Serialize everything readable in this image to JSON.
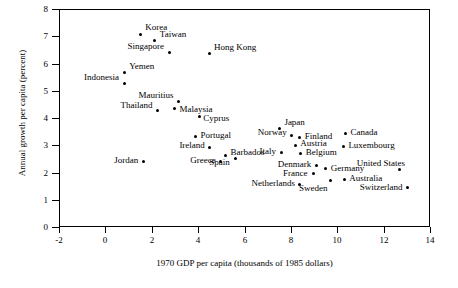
{
  "chart_data": {
    "type": "scatter",
    "title": "",
    "xlabel": "1970 GDP per capita (thousands of 1985 dollars)",
    "ylabel": "Annual growth per capita (percent)",
    "xlim": [
      -2,
      14
    ],
    "ylim": [
      0,
      8
    ],
    "xticks": [
      "-2",
      "0",
      "2",
      "4",
      "6",
      "8",
      "10",
      "12",
      "14"
    ],
    "xtick_values": [
      -2,
      0,
      2,
      4,
      6,
      8,
      10,
      12,
      14
    ],
    "yticks": [
      "0",
      "1",
      "2",
      "3",
      "4",
      "5",
      "6",
      "7",
      "8"
    ],
    "ytick_values": [
      0,
      1,
      2,
      3,
      4,
      5,
      6,
      7,
      8
    ],
    "grid": false,
    "legend": false,
    "points": [
      {
        "label": "Korea",
        "x": 1.5,
        "y": 7.07,
        "lx": 1.72,
        "ly": 7.3,
        "anchor": "left"
      },
      {
        "label": "Taiwan",
        "x": 2.13,
        "y": 6.85,
        "lx": 2.35,
        "ly": 7.05,
        "anchor": "left"
      },
      {
        "label": "Singapore",
        "x": 2.77,
        "y": 6.4,
        "lx": 2.55,
        "ly": 6.6,
        "anchor": "right"
      },
      {
        "label": "Hong Kong",
        "x": 4.47,
        "y": 6.36,
        "lx": 4.69,
        "ly": 6.57,
        "anchor": "left"
      },
      {
        "label": "Yemen",
        "x": 0.81,
        "y": 5.66,
        "lx": 1.03,
        "ly": 5.86,
        "anchor": "left"
      },
      {
        "label": "Indonesia",
        "x": 0.81,
        "y": 5.27,
        "lx": 0.59,
        "ly": 5.45,
        "anchor": "right"
      },
      {
        "label": "Mauritius",
        "x": 3.16,
        "y": 4.6,
        "lx": 2.94,
        "ly": 4.8,
        "anchor": "right"
      },
      {
        "label": "Thailand",
        "x": 2.25,
        "y": 4.27,
        "lx": 2.03,
        "ly": 4.45,
        "anchor": "right"
      },
      {
        "label": "Malaysia",
        "x": 2.98,
        "y": 4.35,
        "lx": 3.2,
        "ly": 4.3,
        "anchor": "left"
      },
      {
        "label": "Cyprus",
        "x": 4.04,
        "y": 4.05,
        "lx": 4.22,
        "ly": 3.98,
        "anchor": "left"
      },
      {
        "label": "Portugal",
        "x": 3.88,
        "y": 3.32,
        "lx": 4.1,
        "ly": 3.34,
        "anchor": "left"
      },
      {
        "label": "Ireland",
        "x": 4.49,
        "y": 2.92,
        "lx": 4.27,
        "ly": 2.98,
        "anchor": "right"
      },
      {
        "label": "Japan",
        "x": 7.5,
        "y": 3.63,
        "lx": 7.72,
        "ly": 3.82,
        "anchor": "left"
      },
      {
        "label": "Norway",
        "x": 8.04,
        "y": 3.35,
        "lx": 7.82,
        "ly": 3.44,
        "anchor": "right"
      },
      {
        "label": "Finland",
        "x": 8.38,
        "y": 3.3,
        "lx": 8.6,
        "ly": 3.3,
        "anchor": "left"
      },
      {
        "label": "Austria",
        "x": 8.18,
        "y": 3.0,
        "lx": 8.4,
        "ly": 3.05,
        "anchor": "left"
      },
      {
        "label": "Canada",
        "x": 10.35,
        "y": 3.42,
        "lx": 10.57,
        "ly": 3.46,
        "anchor": "left"
      },
      {
        "label": "Luxembourg",
        "x": 10.26,
        "y": 2.95,
        "lx": 10.48,
        "ly": 2.98,
        "anchor": "left"
      },
      {
        "label": "Italy",
        "x": 7.6,
        "y": 2.72,
        "lx": 7.38,
        "ly": 2.76,
        "anchor": "right"
      },
      {
        "label": "Belgium",
        "x": 8.42,
        "y": 2.7,
        "lx": 8.64,
        "ly": 2.7,
        "anchor": "left"
      },
      {
        "label": "Barbados",
        "x": 5.18,
        "y": 2.62,
        "lx": 5.4,
        "ly": 2.7,
        "anchor": "left"
      },
      {
        "label": "Spain",
        "x": 5.61,
        "y": 2.5,
        "lx": 5.39,
        "ly": 2.36,
        "anchor": "right"
      },
      {
        "label": "Greece",
        "x": 4.96,
        "y": 2.42,
        "lx": 4.74,
        "ly": 2.42,
        "anchor": "right"
      },
      {
        "label": "Jordan",
        "x": 1.64,
        "y": 2.42,
        "lx": 1.42,
        "ly": 2.42,
        "anchor": "right"
      },
      {
        "label": "United States",
        "x": 12.69,
        "y": 2.1,
        "lx": 12.91,
        "ly": 2.32,
        "anchor": "right"
      },
      {
        "label": "Denmark",
        "x": 9.12,
        "y": 2.25,
        "lx": 8.9,
        "ly": 2.26,
        "anchor": "right"
      },
      {
        "label": "Germany",
        "x": 9.5,
        "y": 2.13,
        "lx": 9.72,
        "ly": 2.13,
        "anchor": "left"
      },
      {
        "label": "France",
        "x": 8.96,
        "y": 1.95,
        "lx": 8.74,
        "ly": 1.96,
        "anchor": "right"
      },
      {
        "label": "Australia",
        "x": 10.3,
        "y": 1.73,
        "lx": 10.52,
        "ly": 1.76,
        "anchor": "left"
      },
      {
        "label": "Netherlands",
        "x": 8.38,
        "y": 1.56,
        "lx": 8.16,
        "ly": 1.58,
        "anchor": "right"
      },
      {
        "label": "Sweden",
        "x": 9.72,
        "y": 1.72,
        "lx": 9.6,
        "ly": 1.4,
        "anchor": "right"
      },
      {
        "label": "Switzerland",
        "x": 13.04,
        "y": 1.46,
        "lx": 12.82,
        "ly": 1.42,
        "anchor": "right"
      }
    ]
  }
}
